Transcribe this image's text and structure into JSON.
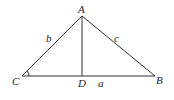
{
  "figure": {
    "type": "triangle-with-altitude",
    "vertices": {
      "A": "A",
      "B": "B",
      "C": "C",
      "D": "D"
    },
    "sides": {
      "a": "a",
      "b": "b",
      "c": "c"
    },
    "segments": [
      "AB",
      "AC",
      "CB",
      "AD"
    ],
    "marked_angle": "C",
    "colors": {
      "stroke": "#333333",
      "text": "#222222"
    }
  }
}
